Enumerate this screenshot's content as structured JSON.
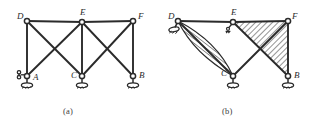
{
  "figure": {
    "type": "engineering-truss-diagram",
    "stroke_color": "#2b2b2b",
    "node_fill": "#ffffff",
    "hatch_color": "#3a3a3a",
    "panels": [
      {
        "id": "a",
        "caption": "(a)",
        "nodes": [
          {
            "name": "D",
            "label": "D",
            "x": 27,
            "y": 21,
            "label_dx": -10,
            "label_dy": -2
          },
          {
            "name": "E",
            "label": "E",
            "x": 82,
            "y": 22,
            "label_dx": -2,
            "label_dy": -7
          },
          {
            "name": "F",
            "label": "F",
            "x": 133,
            "y": 21,
            "label_dx": 5,
            "label_dy": -2
          },
          {
            "name": "A",
            "label": "A",
            "x": 27,
            "y": 76,
            "label_dx": 6,
            "label_dy": 4
          },
          {
            "name": "C",
            "label": "C",
            "x": 82,
            "y": 76,
            "label_dx": -11,
            "label_dy": 2
          },
          {
            "name": "B",
            "label": "B",
            "x": 133,
            "y": 76,
            "label_dx": 6,
            "label_dy": 2
          }
        ],
        "members": [
          {
            "from": "D",
            "to": "E"
          },
          {
            "from": "E",
            "to": "F"
          },
          {
            "from": "D",
            "to": "A"
          },
          {
            "from": "F",
            "to": "B"
          },
          {
            "from": "D",
            "to": "C"
          },
          {
            "from": "E",
            "to": "A"
          },
          {
            "from": "E",
            "to": "C"
          },
          {
            "from": "E",
            "to": "B"
          },
          {
            "from": "F",
            "to": "C"
          },
          {
            "from": "C",
            "to": "C"
          }
        ],
        "supports": [
          {
            "name": "support-A",
            "at": "A",
            "kind": "roller-ground",
            "x": 27,
            "y": 76
          },
          {
            "name": "support-C",
            "at": "C",
            "kind": "roller-ground",
            "x": 82,
            "y": 76
          },
          {
            "name": "support-B",
            "at": "B",
            "kind": "roller-ground",
            "x": 133,
            "y": 76
          },
          {
            "name": "support-A-side",
            "at": "A",
            "kind": "side-link",
            "x": 18,
            "y": 73
          }
        ]
      },
      {
        "id": "b",
        "caption": "(b)",
        "nodes": [
          {
            "name": "D",
            "label": "D",
            "x": 178,
            "y": 21,
            "label_dx": -10,
            "label_dy": -2
          },
          {
            "name": "E",
            "label": "E",
            "x": 233,
            "y": 22,
            "label_dx": -2,
            "label_dy": -7
          },
          {
            "name": "F",
            "label": "F",
            "x": 288,
            "y": 21,
            "label_dx": 4,
            "label_dy": -2
          },
          {
            "name": "C",
            "label": "C",
            "x": 233,
            "y": 76,
            "label_dx": -12,
            "label_dy": 0
          },
          {
            "name": "B",
            "label": "B",
            "x": 288,
            "y": 76,
            "label_dx": 6,
            "label_dy": 2
          }
        ],
        "members": [
          {
            "from": "D",
            "to": "E"
          },
          {
            "from": "E",
            "to": "F"
          },
          {
            "from": "D",
            "to": "C"
          },
          {
            "from": "E",
            "to": "B"
          },
          {
            "from": "F",
            "to": "C"
          },
          {
            "from": "F",
            "to": "B"
          },
          {
            "from": "E",
            "to": "C"
          }
        ],
        "supports": [
          {
            "name": "support-D",
            "at": "D",
            "kind": "roller-ground",
            "x": 176,
            "y": 27
          },
          {
            "name": "support-E",
            "at": "E",
            "kind": "small-link",
            "x": 230,
            "y": 30
          },
          {
            "name": "support-C",
            "at": "C",
            "kind": "roller-ground",
            "x": 233,
            "y": 76
          },
          {
            "name": "support-B",
            "at": "B",
            "kind": "roller-ground",
            "x": 288,
            "y": 76
          }
        ],
        "hatched_regions": [
          {
            "name": "lens-region-DC",
            "shape": "lens",
            "from": "D",
            "to": "C"
          },
          {
            "name": "triangle-region-EFB",
            "shape": "polygon",
            "vertices": [
              "E",
              "F",
              "B"
            ]
          }
        ]
      }
    ]
  }
}
